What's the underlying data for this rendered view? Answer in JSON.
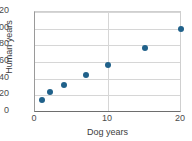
{
  "chart_data": {
    "type": "scatter",
    "title": "",
    "xlabel": "Dog years",
    "ylabel": "Human years",
    "xlim": [
      0,
      20
    ],
    "ylim": [
      0,
      120
    ],
    "xticks": [
      0,
      10,
      20
    ],
    "yticks": [
      0,
      20,
      40,
      60,
      80,
      100,
      120
    ],
    "xtick_labels": [
      "0",
      "10",
      "20"
    ],
    "ytick_labels": [
      "0",
      "20",
      "40",
      "60",
      "80",
      "100",
      "120"
    ],
    "grid": true,
    "legend": null,
    "marker_color": "#20618a",
    "gridline_color": "#d6d6d6",
    "axis_color": "#6e6e6e",
    "points": [
      {
        "x": 1,
        "y": 15
      },
      {
        "x": 2,
        "y": 24
      },
      {
        "x": 4,
        "y": 32
      },
      {
        "x": 7,
        "y": 45
      },
      {
        "x": 10,
        "y": 57
      },
      {
        "x": 15,
        "y": 77
      },
      {
        "x": 20,
        "y": 100
      }
    ]
  }
}
